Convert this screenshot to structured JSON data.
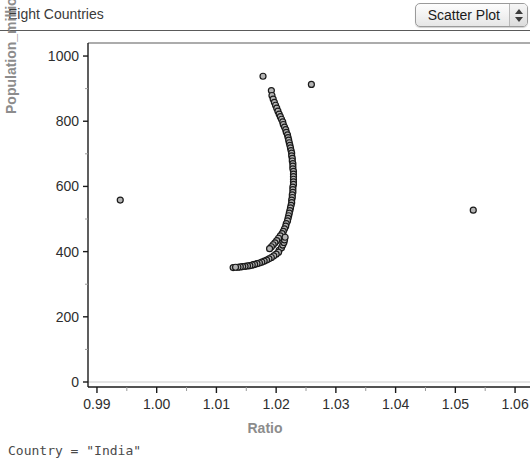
{
  "header": {
    "title": "Eight Countries",
    "plot_type": {
      "selected": "Scatter Plot",
      "options": [
        "Scatter Plot",
        "Histogram",
        "Bar Chart",
        "Line Plot",
        "Box Plot"
      ],
      "stepper_up_icon": "triangle-up-icon",
      "stepper_down_icon": "triangle-down-icon"
    }
  },
  "status": {
    "text": "Country = \"India\""
  },
  "colors": {
    "axis_title": "#8c8c8c",
    "tick_label": "#2e2e2e",
    "axis_line": "#1a1a1a",
    "grid": "#c9c9c9",
    "marker_fill": "#b4b4b4",
    "marker_stroke": "#1a1a1a",
    "frame": "#5a5a5a"
  },
  "chart_data": {
    "type": "scatter",
    "title": "Eight Countries",
    "xlabel": "Ratio",
    "ylabel": "Population_millions",
    "xlim": [
      0.9885,
      1.0625
    ],
    "ylim": [
      0,
      1040
    ],
    "xticks": [
      "0.99",
      "1.00",
      "1.01",
      "1.02",
      "1.03",
      "1.04",
      "1.05",
      "1.06"
    ],
    "xtick_values": [
      0.99,
      1.0,
      1.01,
      1.02,
      1.03,
      1.04,
      1.05,
      1.06
    ],
    "yticks": [
      "0",
      "200",
      "400",
      "600",
      "800",
      "1000"
    ],
    "ytick_values": [
      0,
      200,
      400,
      600,
      800,
      1000
    ],
    "x_minor_ticks": true,
    "y_minor_ticks": true,
    "grid": false,
    "baseline_gridline_y": 0,
    "legend": null,
    "marker": {
      "shape": "circle",
      "size_px": 6,
      "fill": "#b4b4b4",
      "stroke": "#1a1a1a"
    },
    "series": [
      {
        "name": "Country",
        "points": [
          [
            0.9939,
            558
          ],
          [
            1.0128,
            351
          ],
          [
            1.0162,
            360
          ],
          [
            1.0178,
            938
          ],
          [
            1.0259,
            913
          ],
          [
            1.0192,
            894
          ],
          [
            1.0193,
            879
          ],
          [
            1.0195,
            868
          ],
          [
            1.0197,
            858
          ],
          [
            1.0199,
            849
          ],
          [
            1.0201,
            840
          ],
          [
            1.0203,
            831
          ],
          [
            1.0205,
            822
          ],
          [
            1.0207,
            814
          ],
          [
            1.0209,
            806
          ],
          [
            1.0211,
            798
          ],
          [
            1.0212,
            790
          ],
          [
            1.0214,
            782
          ],
          [
            1.0216,
            774
          ],
          [
            1.0217,
            766
          ],
          [
            1.0219,
            758
          ],
          [
            1.022,
            750
          ],
          [
            1.0221,
            742
          ],
          [
            1.0222,
            734
          ],
          [
            1.0223,
            726
          ],
          [
            1.0224,
            718
          ],
          [
            1.0225,
            710
          ],
          [
            1.0226,
            702
          ],
          [
            1.0226,
            694
          ],
          [
            1.0227,
            686
          ],
          [
            1.0227,
            678
          ],
          [
            1.0228,
            670
          ],
          [
            1.0228,
            662
          ],
          [
            1.0228,
            654
          ],
          [
            1.0229,
            646
          ],
          [
            1.0229,
            638
          ],
          [
            1.0229,
            630
          ],
          [
            1.0229,
            622
          ],
          [
            1.0229,
            614
          ],
          [
            1.0229,
            606
          ],
          [
            1.0228,
            598
          ],
          [
            1.0228,
            590
          ],
          [
            1.0228,
            582
          ],
          [
            1.0227,
            574
          ],
          [
            1.0227,
            566
          ],
          [
            1.0226,
            558
          ],
          [
            1.0226,
            550
          ],
          [
            1.0225,
            542
          ],
          [
            1.0224,
            534
          ],
          [
            1.0223,
            526
          ],
          [
            1.0222,
            518
          ],
          [
            1.0221,
            510
          ],
          [
            1.022,
            502
          ],
          [
            1.0219,
            494
          ],
          [
            1.0217,
            486
          ],
          [
            1.0216,
            478
          ],
          [
            1.0214,
            470
          ],
          [
            1.0212,
            462
          ],
          [
            1.021,
            455
          ],
          [
            1.0207,
            448
          ],
          [
            1.0204,
            441
          ],
          [
            1.0201,
            434
          ],
          [
            1.0198,
            427
          ],
          [
            1.0195,
            421
          ],
          [
            1.0192,
            415
          ],
          [
            1.0189,
            409
          ],
          [
            1.0205,
            404
          ],
          [
            1.0209,
            412
          ],
          [
            1.0211,
            420
          ],
          [
            1.0213,
            428
          ],
          [
            1.0214,
            436
          ],
          [
            1.0215,
            444
          ],
          [
            1.0204,
            398
          ],
          [
            1.02,
            392
          ],
          [
            1.0196,
            387
          ],
          [
            1.0192,
            382
          ],
          [
            1.0188,
            378
          ],
          [
            1.0184,
            374
          ],
          [
            1.018,
            371
          ],
          [
            1.0176,
            368
          ],
          [
            1.0172,
            365
          ],
          [
            1.0168,
            363
          ],
          [
            1.0164,
            361
          ],
          [
            1.016,
            359
          ],
          [
            1.0156,
            357
          ],
          [
            1.0152,
            356
          ],
          [
            1.0148,
            355
          ],
          [
            1.0144,
            354
          ],
          [
            1.014,
            353
          ],
          [
            1.0136,
            352
          ],
          [
            1.0132,
            352
          ],
          [
            1.053,
            527
          ]
        ]
      }
    ]
  }
}
